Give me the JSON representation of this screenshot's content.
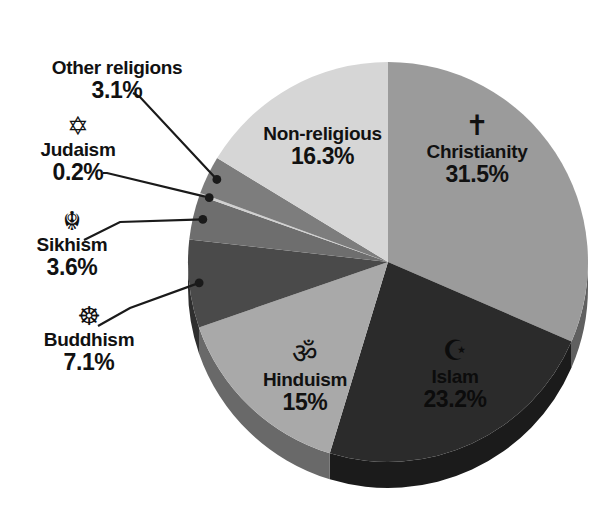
{
  "chart_data": {
    "type": "pie",
    "title": "",
    "subtitle": "",
    "xlabel": "",
    "ylabel": "",
    "unit": "%",
    "total": 100,
    "start_angle_deg": 0,
    "direction": "clockwise",
    "legend_position": "none",
    "grid": false,
    "style": "3d-pie",
    "categories": [
      "Christianity",
      "Islam",
      "Hinduism",
      "Buddhism",
      "Sikhism",
      "Judaism",
      "Other religions",
      "Non-religious"
    ],
    "values": [
      31.5,
      23.2,
      15,
      7.1,
      3.6,
      0.2,
      3.1,
      16.3
    ],
    "labels": [
      "31.5%",
      "23.2%",
      "15%",
      "7.1%",
      "3.6%",
      "0.2%",
      "3.1%",
      "16.3%"
    ],
    "colors": [
      "#9b9b9b",
      "#2b2b2b",
      "#a9a9a9",
      "#4a4a4a",
      "#6e6e6e",
      "#d0d0d0",
      "#7d7d7d",
      "#d6d6d6"
    ],
    "slices": [
      {
        "name": "Christianity",
        "value": 31.5,
        "label": "31.5%",
        "color": "#9b9b9b",
        "icon": "cross-icon",
        "glyph": "✝",
        "label_placement": "inside",
        "text_on_dark": false
      },
      {
        "name": "Islam",
        "value": 23.2,
        "label": "23.2%",
        "color": "#2b2b2b",
        "icon": "star-and-crescent-icon",
        "glyph": "☪",
        "label_placement": "inside",
        "text_on_dark": true
      },
      {
        "name": "Hinduism",
        "value": 15,
        "label": "15%",
        "color": "#a9a9a9",
        "icon": "om-icon",
        "glyph": "ॐ",
        "label_placement": "inside",
        "text_on_dark": false
      },
      {
        "name": "Buddhism",
        "value": 7.1,
        "label": "7.1%",
        "color": "#4a4a4a",
        "icon": "dharma-wheel-icon",
        "glyph": "☸",
        "label_placement": "outside",
        "text_on_dark": false
      },
      {
        "name": "Sikhism",
        "value": 3.6,
        "label": "3.6%",
        "color": "#6e6e6e",
        "icon": "khanda-icon",
        "glyph": "☬",
        "label_placement": "outside",
        "text_on_dark": false
      },
      {
        "name": "Judaism",
        "value": 0.2,
        "label": "0.2%",
        "color": "#d0d0d0",
        "icon": "star-of-david-icon",
        "glyph": "✡",
        "label_placement": "outside",
        "text_on_dark": false
      },
      {
        "name": "Other religions",
        "value": 3.1,
        "label": "3.1%",
        "color": "#7d7d7d",
        "icon": "none",
        "glyph": "",
        "label_placement": "outside",
        "text_on_dark": false
      },
      {
        "name": "Non-religious",
        "value": 16.3,
        "label": "16.3%",
        "color": "#d6d6d6",
        "icon": "none",
        "glyph": "",
        "label_placement": "inside",
        "text_on_dark": false
      }
    ]
  },
  "labels": {
    "other_religions": {
      "name": "Other religions",
      "value": "3.1%",
      "glyph": ""
    },
    "judaism": {
      "name": "Judaism",
      "value": "0.2%",
      "glyph": "✡"
    },
    "sikhism": {
      "name": "Sikhism",
      "value": "3.6%",
      "glyph": "☬"
    },
    "buddhism": {
      "name": "Buddhism",
      "value": "7.1%",
      "glyph": "☸"
    },
    "christianity": {
      "name": "Christianity",
      "value": "31.5%",
      "glyph": "✝"
    },
    "islam": {
      "name": "Islam",
      "value": "23.2%",
      "glyph": "☪"
    },
    "hinduism": {
      "name": "Hinduism",
      "value": "15%",
      "glyph": "ॐ"
    },
    "non_religious": {
      "name": "Non-religious",
      "value": "16.3%",
      "glyph": ""
    }
  },
  "theme": {
    "background": "#ffffff",
    "text": "#111111",
    "leader_line": "#1a1a1a"
  }
}
